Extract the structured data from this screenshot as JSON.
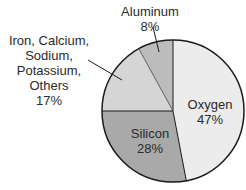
{
  "chart_data": {
    "type": "pie",
    "title": "",
    "start_angle_deg": 0,
    "direction": "clockwise",
    "slices": [
      {
        "label": "Oxygen",
        "value": 47,
        "display": "47%",
        "color": "#ececec"
      },
      {
        "label": "Silicon",
        "value": 28,
        "display": "28%",
        "color": "#a9a9a9"
      },
      {
        "label": "Iron, Calcium, Sodium, Potassium, Others",
        "value": 17,
        "display": "17%",
        "color": "#d5d5d5"
      },
      {
        "label": "Aluminum",
        "value": 8,
        "display": "8%",
        "color": "#bcbcbc"
      }
    ],
    "categories": [
      "Oxygen",
      "Silicon",
      "Iron, Calcium, Sodium, Potassium, Others",
      "Aluminum"
    ],
    "values": [
      47,
      28,
      17,
      8
    ],
    "unit": "%"
  },
  "labels": {
    "oxygen": {
      "name": "Oxygen",
      "pct": "47%"
    },
    "silicon": {
      "name": "Silicon",
      "pct": "28%"
    },
    "others": {
      "lines": [
        "Iron, Calcium,",
        "Sodium,",
        "Potassium,",
        "Others"
      ],
      "pct": "17%"
    },
    "aluminum": {
      "name": "Aluminum",
      "pct": "8%"
    }
  },
  "geometry": {
    "cx": 173,
    "cy": 111,
    "r": 71
  },
  "style": {
    "outline": "#1a1a1a",
    "leader": "#1a1a1a"
  }
}
